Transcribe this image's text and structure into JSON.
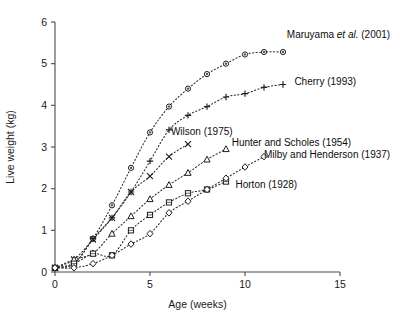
{
  "chart_data": {
    "type": "line",
    "title": "",
    "xlabel": "Age (weeks)",
    "ylabel": "Live weight (kg)",
    "xlim": [
      0,
      15
    ],
    "ylim": [
      0,
      6
    ],
    "xticks": [
      0,
      5,
      10,
      15
    ],
    "yticks": [
      0,
      1,
      2,
      3,
      4,
      5,
      6
    ],
    "grid": false,
    "legend_position": "inline-right-of-series",
    "series": [
      {
        "name": "Maruyama et al. (2001)",
        "label_plain": "Maruyama ",
        "label_italic": "et al.",
        "label_tail": " (2001)",
        "marker": "circle",
        "x": [
          0,
          1,
          2,
          3,
          4,
          5,
          6,
          7,
          8,
          9,
          10,
          11,
          12
        ],
        "y": [
          0.1,
          0.2,
          0.8,
          1.6,
          2.5,
          3.35,
          3.97,
          4.4,
          4.75,
          5.0,
          5.22,
          5.28,
          5.28
        ]
      },
      {
        "name": "Cherry (1993)",
        "label_plain": "Cherry (1993)",
        "label_italic": "",
        "label_tail": "",
        "marker": "plus",
        "x": [
          0,
          1,
          2,
          3,
          4,
          5,
          6,
          7,
          8,
          9,
          10,
          11,
          12
        ],
        "y": [
          0.1,
          0.2,
          0.8,
          1.3,
          1.92,
          2.66,
          3.41,
          3.76,
          3.97,
          4.2,
          4.28,
          4.43,
          4.5
        ]
      },
      {
        "name": "Wilson (1975)",
        "label_plain": "Wilson (1975)",
        "label_italic": "",
        "label_tail": "",
        "marker": "cross",
        "x": [
          0,
          1,
          2,
          3,
          4,
          5,
          6,
          7
        ],
        "y": [
          0.1,
          0.3,
          0.78,
          1.3,
          1.92,
          2.3,
          2.77,
          3.07
        ]
      },
      {
        "name": "Hunter and Scholes (1954)",
        "label_plain": "Hunter and Scholes (1954)",
        "label_italic": "",
        "label_tail": "",
        "marker": "triangle",
        "x": [
          0,
          1,
          2,
          3,
          4,
          5,
          6,
          7,
          8,
          9
        ],
        "y": [
          0.1,
          0.3,
          0.45,
          0.92,
          1.34,
          1.75,
          2.09,
          2.38,
          2.7,
          2.95
        ]
      },
      {
        "name": "Milby and Henderson (1937)",
        "label_plain": "Milby and Henderson (1937)",
        "label_italic": "",
        "label_tail": "",
        "marker": "square",
        "x": [
          0,
          1,
          2,
          3,
          4,
          5,
          6,
          7,
          8,
          9
        ],
        "y": [
          0.1,
          0.2,
          0.44,
          0.4,
          1.0,
          1.37,
          1.67,
          1.89,
          1.98,
          2.17
        ]
      },
      {
        "name": "Horton (1928)",
        "label_plain": "Horton (1928)",
        "label_italic": "",
        "label_tail": "",
        "marker": "diamond",
        "x": [
          0,
          1,
          2,
          3,
          4,
          5,
          6,
          7,
          8,
          9,
          10,
          11
        ],
        "y": [
          0.1,
          0.1,
          0.2,
          0.4,
          0.67,
          0.92,
          1.42,
          1.7,
          1.98,
          2.25,
          2.52,
          2.77
        ]
      }
    ],
    "annotations": [
      {
        "text": "Maruyama et al. (2001)",
        "x": 12.2,
        "y": 5.62
      },
      {
        "text": "Cherry (1993)",
        "x": 12.6,
        "y": 4.48
      },
      {
        "text": "Wilson (1975)",
        "x": 6.1,
        "y": 3.28
      },
      {
        "text": "Hunter and Scholes (1954)",
        "x": 9.3,
        "y": 3.02
      },
      {
        "text": "Horton (1928)",
        "x": 11.0,
        "y": 2.73
      },
      {
        "text": "Milby and Henderson (1937)",
        "x": 9.5,
        "y": 2.02
      }
    ],
    "colors": {
      "line": "#2b2b2b",
      "marker_stroke": "#1f1f1f",
      "marker_fill": "#ffffff",
      "axis": "#4a4a4a",
      "text": "#1a1a1a",
      "background": "#ffffff"
    }
  }
}
